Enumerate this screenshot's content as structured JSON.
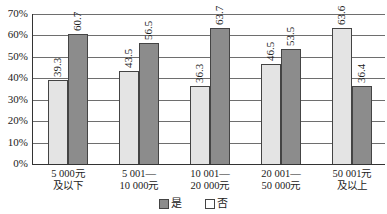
{
  "chart_data": {
    "type": "bar",
    "title": "",
    "xlabel": "",
    "ylabel": "",
    "categories": [
      "5 000元\n及以下",
      "5 001—\n10 000元",
      "10 001—\n20 000元",
      "20 001—\n50 000元",
      "50 001元\n及以上"
    ],
    "category_lines": [
      [
        "5 000元",
        "及以下"
      ],
      [
        "5 001—",
        "10 000元"
      ],
      [
        "10 001—",
        "20 000元"
      ],
      [
        "20 001—",
        "50 000元"
      ],
      [
        "50 001元",
        "及以上"
      ]
    ],
    "series": [
      {
        "name": "否",
        "color": "#e4e4e4",
        "values": [
          39.3,
          43.5,
          36.3,
          46.5,
          63.6
        ]
      },
      {
        "name": "是",
        "color": "#8c8c8c",
        "values": [
          60.7,
          56.5,
          63.7,
          53.5,
          36.4
        ]
      }
    ],
    "data_labels": [
      [
        "39.3",
        "43.5",
        "36.3",
        "46.5",
        "63.6"
      ],
      [
        "60.7",
        "56.5",
        "63.7",
        "53.5",
        "36.4"
      ]
    ],
    "ylim": [
      0,
      70
    ],
    "yticks": [
      "0%",
      "10%",
      "20%",
      "30%",
      "40%",
      "50%",
      "60%",
      "70%"
    ],
    "grid": true,
    "legend": {
      "position": "bottom",
      "entries": [
        {
          "label": "是",
          "color": "#8c8c8c"
        },
        {
          "label": "否",
          "color": "#ffffff"
        }
      ]
    }
  }
}
